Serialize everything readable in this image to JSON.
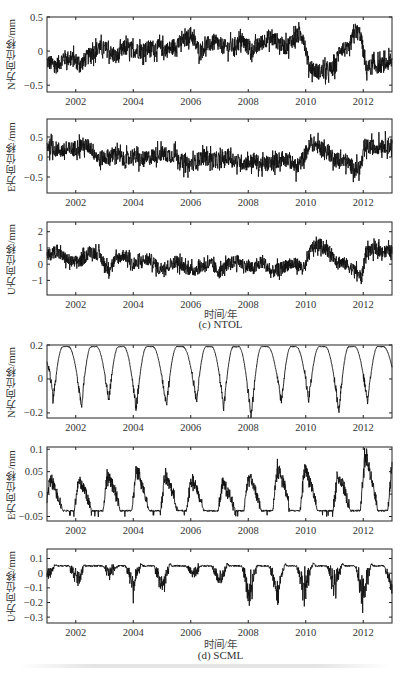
{
  "figure": {
    "groups": [
      {
        "caption": "(c) NTOL",
        "xtitle": "时间/年"
      },
      {
        "caption": "(d) SCML",
        "xtitle": "时间/年"
      }
    ]
  },
  "chart_data": [
    {
      "type": "line",
      "station": "NTOL",
      "component": "N",
      "ylabel": "N方向位移/mm",
      "xlabel": "",
      "xlim": [
        2001.0,
        2013.0
      ],
      "ylim": [
        -0.6,
        0.5
      ],
      "yticks": [
        -0.5,
        0,
        0.5
      ],
      "yticklabels": [
        "−0.5",
        "0",
        "0.5"
      ],
      "xticks": [
        2002,
        2004,
        2006,
        2008,
        2010,
        2012
      ],
      "grid": false,
      "x": [
        2001.0,
        2001.3,
        2001.6,
        2001.9,
        2002.2,
        2002.5,
        2002.8,
        2003.1,
        2003.4,
        2003.7,
        2004.0,
        2004.3,
        2004.6,
        2004.9,
        2005.2,
        2005.5,
        2005.8,
        2006.0,
        2006.3,
        2006.6,
        2006.9,
        2007.2,
        2007.5,
        2007.8,
        2008.1,
        2008.4,
        2008.7,
        2009.0,
        2009.3,
        2009.6,
        2009.9,
        2010.1,
        2010.4,
        2010.7,
        2011.0,
        2011.2,
        2011.5,
        2011.7,
        2011.9,
        2012.1,
        2012.4,
        2012.7,
        2013.0
      ],
      "values": [
        -0.15,
        -0.22,
        -0.1,
        -0.12,
        -0.18,
        -0.05,
        0.05,
        0.02,
        -0.1,
        0.05,
        0.02,
        0.0,
        0.05,
        0.05,
        0.02,
        0.1,
        0.15,
        0.25,
        0.0,
        0.1,
        0.12,
        0.05,
        0.08,
        0.15,
        0.0,
        0.1,
        0.2,
        0.15,
        0.05,
        0.2,
        0.25,
        -0.2,
        -0.3,
        -0.3,
        -0.25,
        0.05,
        0.0,
        0.3,
        0.25,
        -0.25,
        -0.22,
        -0.2,
        -0.15
      ],
      "noise": 0.12
    },
    {
      "type": "line",
      "station": "NTOL",
      "component": "E",
      "ylabel": "E方向位移/mm",
      "xlabel": "",
      "xlim": [
        2001.0,
        2013.0
      ],
      "ylim": [
        -0.9,
        0.95
      ],
      "yticks": [
        -0.5,
        0,
        0.5
      ],
      "yticklabels": [
        "−0.5",
        "0",
        "0.5"
      ],
      "xticks": [
        2002,
        2004,
        2006,
        2008,
        2010,
        2012
      ],
      "grid": false,
      "x": [
        2001.0,
        2001.3,
        2001.6,
        2001.9,
        2002.2,
        2002.5,
        2002.8,
        2003.1,
        2003.4,
        2003.7,
        2004.0,
        2004.3,
        2004.6,
        2004.9,
        2005.2,
        2005.5,
        2005.8,
        2006.1,
        2006.4,
        2006.7,
        2007.0,
        2007.3,
        2007.6,
        2007.9,
        2008.2,
        2008.5,
        2008.8,
        2009.1,
        2009.4,
        2009.7,
        2010.0,
        2010.2,
        2010.5,
        2010.8,
        2011.1,
        2011.4,
        2011.7,
        2011.9,
        2012.1,
        2012.4,
        2012.7,
        2013.0
      ],
      "values": [
        0.3,
        0.2,
        0.15,
        0.2,
        0.3,
        0.25,
        -0.05,
        0.0,
        0.1,
        -0.1,
        0.05,
        -0.1,
        0.0,
        0.1,
        0.05,
        0.05,
        -0.2,
        -0.15,
        0.0,
        -0.05,
        -0.1,
        0.0,
        -0.1,
        -0.15,
        -0.1,
        -0.2,
        -0.15,
        -0.05,
        -0.05,
        -0.3,
        0.1,
        0.35,
        0.25,
        0.1,
        -0.1,
        -0.1,
        -0.3,
        -0.25,
        0.25,
        0.25,
        0.3,
        0.3
      ],
      "noise": 0.2
    },
    {
      "type": "line",
      "station": "NTOL",
      "component": "U",
      "ylabel": "U方向位移/mm",
      "xlabel": "时间/年",
      "xlim": [
        2001.0,
        2013.0
      ],
      "ylim": [
        -1.9,
        2.6
      ],
      "yticks": [
        -1,
        0,
        1,
        2
      ],
      "yticklabels": [
        "−1",
        "0",
        "1",
        "2"
      ],
      "xticks": [
        2002,
        2004,
        2006,
        2008,
        2010,
        2012
      ],
      "grid": false,
      "x": [
        2001.0,
        2001.3,
        2001.6,
        2001.9,
        2002.2,
        2002.5,
        2002.8,
        2003.1,
        2003.4,
        2003.7,
        2004.0,
        2004.3,
        2004.6,
        2004.9,
        2005.2,
        2005.5,
        2005.8,
        2006.1,
        2006.4,
        2006.7,
        2007.0,
        2007.3,
        2007.6,
        2007.9,
        2008.2,
        2008.5,
        2008.8,
        2009.1,
        2009.4,
        2009.7,
        2009.95,
        2010.2,
        2010.5,
        2010.8,
        2011.1,
        2011.4,
        2011.7,
        2011.95,
        2012.1,
        2012.4,
        2012.7,
        2013.0
      ],
      "values": [
        0.5,
        0.8,
        0.4,
        0.1,
        0.2,
        0.8,
        0.6,
        -0.3,
        0.3,
        0.6,
        -0.1,
        0.2,
        0.3,
        -0.3,
        -0.1,
        0.2,
        -0.2,
        -0.4,
        -0.1,
        0.0,
        -0.5,
        0.0,
        0.2,
        -0.1,
        -0.3,
        0.2,
        -0.5,
        -0.3,
        0.0,
        0.0,
        -0.3,
        1.0,
        1.2,
        0.8,
        0.2,
        0.0,
        -0.4,
        -0.8,
        0.8,
        0.9,
        0.8,
        0.8
      ],
      "noise": 0.4
    },
    {
      "type": "line",
      "station": "SCML",
      "component": "N",
      "ylabel": "N方向位移/mm",
      "xlabel": "",
      "xlim": [
        2001.0,
        2013.0
      ],
      "ylim": [
        -0.23,
        0.2
      ],
      "yticks": [
        -0.2,
        0,
        0.2
      ],
      "yticklabels": [
        "−0.2",
        "0",
        "0.2"
      ],
      "xticks": [
        2002,
        2004,
        2006,
        2008,
        2010,
        2012
      ],
      "grid": false,
      "seasonal": {
        "peak": 0.19,
        "trough_year_fraction": 0.15,
        "peak_year_fraction": 0.6
      },
      "trough_years": [
        2001.2,
        2002.2,
        2003.15,
        2004.1,
        2005.15,
        2006.2,
        2007.15,
        2008.1,
        2009.15,
        2010.1,
        2011.15,
        2012.15
      ],
      "trough_values": [
        -0.15,
        -0.16,
        -0.13,
        -0.18,
        -0.16,
        -0.13,
        -0.17,
        -0.23,
        -0.14,
        -0.12,
        -0.19,
        -0.14
      ],
      "end_value": -0.05,
      "noise": 0.01
    },
    {
      "type": "line",
      "station": "SCML",
      "component": "E",
      "ylabel": "E方向位移/mm",
      "xlabel": "",
      "xlim": [
        2001.0,
        2013.0
      ],
      "ylim": [
        -0.06,
        0.105
      ],
      "yticks": [
        -0.05,
        0,
        0.05,
        0.1
      ],
      "yticklabels": [
        "−0.05",
        "0",
        "0.05",
        "0.1"
      ],
      "xticks": [
        2002,
        2004,
        2006,
        2008,
        2010,
        2012
      ],
      "grid": false,
      "baseline": -0.037,
      "peak_years": [
        2001.1,
        2002.1,
        2003.1,
        2004.1,
        2005.1,
        2006.0,
        2007.1,
        2008.0,
        2009.0,
        2009.95,
        2011.1,
        2012.05,
        2013.0
      ],
      "peak_values": [
        0.04,
        0.04,
        0.05,
        0.06,
        0.05,
        0.04,
        0.03,
        0.05,
        0.07,
        0.07,
        0.05,
        0.1,
        0.08
      ],
      "noise": 0.008
    },
    {
      "type": "line",
      "station": "SCML",
      "component": "U",
      "ylabel": "U方向位移/mm",
      "xlabel": "时间/年",
      "xlim": [
        2001.0,
        2013.0
      ],
      "ylim": [
        -0.34,
        0.165
      ],
      "yticks": [
        -0.3,
        -0.2,
        -0.1,
        0,
        0.1
      ],
      "yticklabels": [
        "−0.3",
        "−0.2",
        "−0.1",
        "0",
        "0.1"
      ],
      "xticks": [
        2002,
        2004,
        2006,
        2008,
        2010,
        2012
      ],
      "grid": false,
      "baseline": 0.05,
      "dip_years": [
        2001.05,
        2002.05,
        2003.2,
        2004.0,
        2005.0,
        2006.1,
        2007.0,
        2008.05,
        2009.0,
        2009.95,
        2011.0,
        2012.0,
        2013.0
      ],
      "dip_values": [
        -0.06,
        -0.13,
        -0.05,
        -0.18,
        -0.21,
        -0.06,
        -0.16,
        -0.31,
        -0.27,
        -0.25,
        -0.2,
        -0.34,
        -0.22
      ],
      "noise": 0.02
    }
  ]
}
